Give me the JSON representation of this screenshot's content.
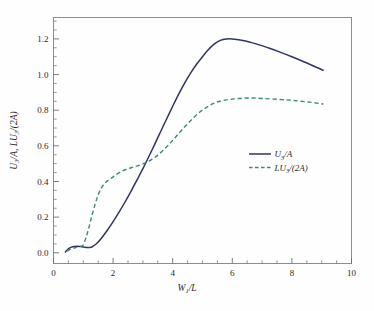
{
  "chart_data": {
    "type": "line",
    "title": "",
    "xlabel": "W1/L",
    "xlabel_parts": {
      "base": "W",
      "sub": "1",
      "rest": "/L"
    },
    "ylabel": "U3/A, LU3/(2A)",
    "ylabel_parts": {
      "p1": "U",
      "s1": "3",
      "p2": "/A, ",
      "p3": "LU",
      "s2": "3",
      "p4": "/(2A)"
    },
    "xlim": [
      0,
      10
    ],
    "ylim": [
      -0.06,
      1.32
    ],
    "xticks": [
      0,
      2,
      4,
      6,
      8,
      10
    ],
    "xtick_labels": [
      "0",
      "2",
      "4",
      "6",
      "8",
      "10"
    ],
    "yticks": [
      0.0,
      0.2,
      0.4,
      0.6,
      0.8,
      1.0,
      1.2
    ],
    "ytick_labels": [
      "0.0",
      "0.2",
      "0.4",
      "0.6",
      "0.8",
      "1.0",
      "1.2"
    ],
    "xminor_step": 0.5,
    "yminor_step": 0.05,
    "grid": false,
    "legend_position": "center-right",
    "series": [
      {
        "name": "U3/A",
        "label_parts": {
          "p1": "U",
          "s1": "3",
          "p2": "/A"
        },
        "style": "solid",
        "color": "#2f3566",
        "x": [
          0.4,
          0.5,
          0.6,
          0.7,
          0.8,
          0.9,
          1.0,
          1.1,
          1.2,
          1.3,
          1.45,
          1.6,
          1.8,
          2.0,
          2.2,
          2.4,
          2.6,
          2.8,
          3.0,
          3.2,
          3.4,
          3.6,
          3.8,
          4.0,
          4.2,
          4.4,
          4.6,
          4.8,
          5.0,
          5.2,
          5.4,
          5.6,
          5.8,
          6.0,
          6.4,
          6.8,
          7.2,
          7.6,
          8.0,
          8.4,
          8.8,
          9.05
        ],
        "y": [
          0.005,
          0.022,
          0.032,
          0.036,
          0.037,
          0.035,
          0.032,
          0.03,
          0.03,
          0.034,
          0.052,
          0.08,
          0.125,
          0.175,
          0.228,
          0.285,
          0.345,
          0.408,
          0.472,
          0.54,
          0.61,
          0.682,
          0.752,
          0.822,
          0.89,
          0.952,
          1.008,
          1.058,
          1.1,
          1.14,
          1.172,
          1.192,
          1.2,
          1.2,
          1.19,
          1.172,
          1.15,
          1.126,
          1.1,
          1.072,
          1.042,
          1.024
        ]
      },
      {
        "name": "LU3/(2A)",
        "label_parts": {
          "p1": "LU",
          "s1": "3",
          "p2": "/(2A)"
        },
        "style": "dashed",
        "color": "#3c8a7c",
        "x": [
          0.45,
          0.6,
          0.75,
          0.9,
          1.0,
          1.1,
          1.2,
          1.3,
          1.4,
          1.5,
          1.6,
          1.7,
          1.8,
          1.95,
          2.1,
          2.3,
          2.5,
          2.7,
          2.9,
          3.1,
          3.3,
          3.5,
          3.7,
          3.9,
          4.1,
          4.3,
          4.5,
          4.7,
          4.9,
          5.1,
          5.3,
          5.5,
          5.8,
          6.1,
          6.4,
          6.7,
          7.0,
          7.4,
          7.8,
          8.2,
          8.6,
          9.0,
          9.05
        ],
        "y": [
          0.01,
          0.022,
          0.03,
          0.036,
          0.045,
          0.09,
          0.15,
          0.215,
          0.275,
          0.325,
          0.362,
          0.386,
          0.402,
          0.42,
          0.438,
          0.458,
          0.472,
          0.482,
          0.492,
          0.506,
          0.524,
          0.548,
          0.578,
          0.612,
          0.65,
          0.688,
          0.724,
          0.758,
          0.788,
          0.812,
          0.832,
          0.846,
          0.858,
          0.864,
          0.868,
          0.868,
          0.866,
          0.862,
          0.858,
          0.852,
          0.845,
          0.836,
          0.833
        ]
      }
    ]
  },
  "legend": {
    "entries": [
      {
        "label": "U3/A",
        "style": "solid"
      },
      {
        "label": "LU3/(2A)",
        "style": "dashed"
      }
    ]
  }
}
